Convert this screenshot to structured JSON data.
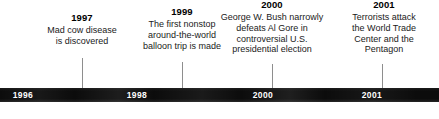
{
  "figure": {
    "type": "historical-timeline",
    "orientation": "horizontal",
    "bar_color": "#0c0c0c",
    "bar_label_color": "#ffffff",
    "tick_color": "#8e8e8e",
    "text_color": "#111111"
  },
  "axis": {
    "labels": [
      {
        "year": "1996"
      },
      {
        "year": "1998"
      },
      {
        "year": "2000"
      },
      {
        "year": "2001"
      }
    ]
  },
  "events": [
    {
      "year": "1997",
      "description": "Mad cow disease\nis discovered"
    },
    {
      "year": "1999",
      "description": "The first nonstop\naround-the-world\nballoon trip is made"
    },
    {
      "year": "2000",
      "description": "George W. Bush narrowly\ndefeats Al Gore in\ncontroversial U.S.\npresidential election"
    },
    {
      "year": "2001",
      "description": "Terrorists attack\nthe World Trade\nCenter and the\nPentagon"
    }
  ],
  "chart_data": {
    "type": "table",
    "title": "",
    "categories": [
      "1997",
      "1999",
      "2000",
      "2001"
    ],
    "values": [
      "Mad cow disease is discovered",
      "The first nonstop around-the-world balloon trip is made",
      "George W. Bush narrowly defeats Al Gore in controversial U.S. presidential election",
      "Terrorists attack the World Trade Center and the Pentagon"
    ],
    "axis_tick_labels": [
      "1996",
      "1998",
      "2000",
      "2001"
    ],
    "xlabel": "",
    "ylabel": "",
    "grid": false,
    "legend": "none"
  }
}
